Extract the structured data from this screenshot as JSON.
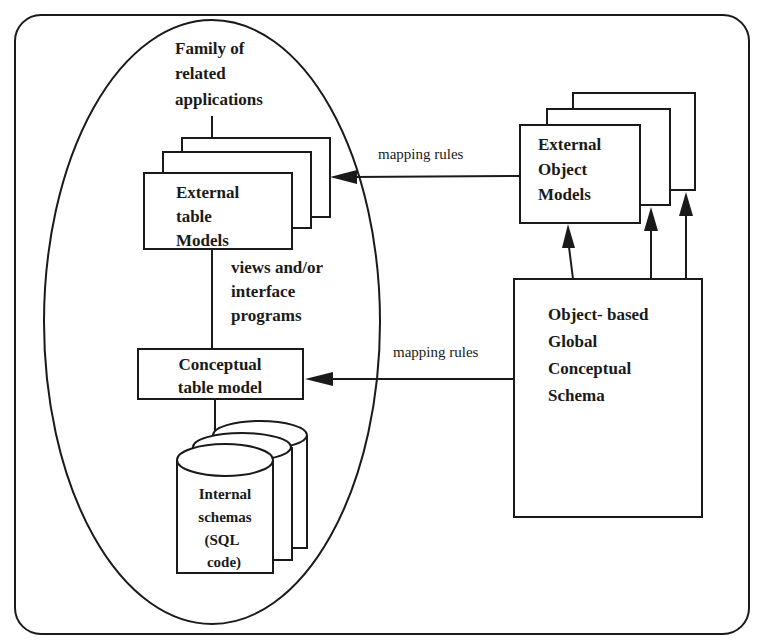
{
  "diagram": {
    "frame": {
      "stroke": "#1a1a1a",
      "background": "#ffffff"
    },
    "ellipse_group": {
      "title_lines": [
        "Family of",
        "related",
        "applications"
      ]
    },
    "external_table_models": {
      "lines": [
        "External",
        "table",
        "Models"
      ]
    },
    "views_label": {
      "lines": [
        "views and/or",
        "interface",
        "programs"
      ]
    },
    "conceptual_table_model": {
      "lines": [
        "Conceptual",
        "table model"
      ]
    },
    "internal_schemas": {
      "lines": [
        "Internal",
        "schemas",
        "(SQL",
        "code)"
      ]
    },
    "external_object_models": {
      "lines": [
        "External",
        "Object",
        "Models"
      ]
    },
    "global_schema": {
      "lines": [
        "Object- based",
        "Global",
        "Conceptual",
        "Schema"
      ]
    },
    "edges": [
      {
        "from": "external-object-models",
        "to": "external-table-models",
        "label": "mapping rules"
      },
      {
        "from": "global-conceptual-schema",
        "to": "conceptual-table-model",
        "label": "mapping rules"
      },
      {
        "from": "global-conceptual-schema",
        "to": "external-object-models",
        "label": ""
      }
    ]
  }
}
